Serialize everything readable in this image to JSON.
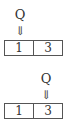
{
  "diagrams": [
    {
      "pointer_label": "Q",
      "arrow": "⇓",
      "cells": [
        "1",
        "3"
      ],
      "pointer_index": 0
    },
    {
      "pointer_label": "Q",
      "arrow": "⇓",
      "cells": [
        "1",
        "3"
      ],
      "pointer_index": 1
    }
  ]
}
